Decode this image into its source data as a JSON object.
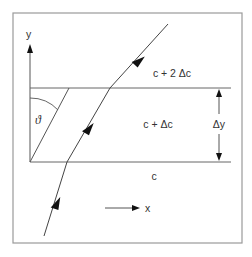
{
  "diagram": {
    "type": "refraction-ray-layers",
    "labels": {
      "y_axis": "y",
      "x_axis": "x",
      "theta": "ϑ",
      "layer_top": "c + 2 Δc",
      "layer_middle": "c + Δc",
      "layer_bottom": "c",
      "delta_y": "Δy"
    },
    "colors": {
      "frame": "#9a9a9a",
      "lines": "#555555",
      "ray": "#444444",
      "arrowhead": "#111111",
      "text": "#333333",
      "background": "#ffffff"
    }
  }
}
